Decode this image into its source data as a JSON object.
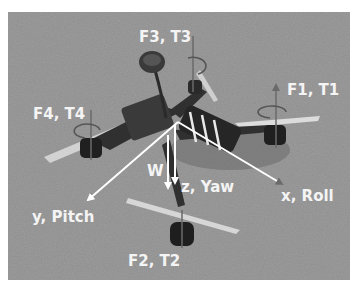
{
  "figure": {
    "labels": {
      "f1": "F1, T1",
      "f2": "F2, T2",
      "f3": "F3, T3",
      "f4": "F4, T4",
      "x_axis": "x, Roll",
      "y_axis": "y, Pitch",
      "z_axis": "z, Yaw",
      "weight": "W"
    },
    "colors": {
      "ground": "#9a9a9a",
      "arrow": "#ffffff",
      "rotor_axis": "#6a6a6a",
      "frame": "#2e2e2e",
      "propeller": "#d8d8d8"
    }
  }
}
